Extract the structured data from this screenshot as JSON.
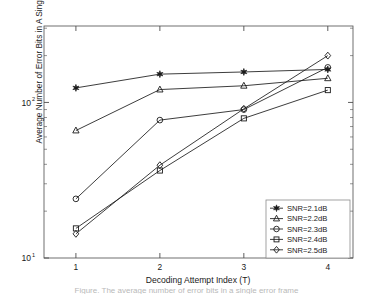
{
  "chart_data": {
    "type": "line",
    "title": "",
    "xlabel": "Decoding Attempt Index (T)",
    "ylabel": "Average Number of Error Bits in A Single Error Frame",
    "x": [
      1,
      2,
      3,
      4
    ],
    "xtick_labels": [
      "1",
      "2",
      "3",
      "4"
    ],
    "xlim": [
      0.62,
      4.3
    ],
    "ylim": [
      10,
      310
    ],
    "yscale": "log",
    "ytick_labels": [
      "10",
      "10"
    ],
    "ytick_exponents": [
      "1",
      "2"
    ],
    "ytick_values": [
      10,
      100
    ],
    "grid": false,
    "legend_position": "lower right",
    "series": [
      {
        "name": "SNR=2.1dB",
        "marker": "star",
        "values": [
          124,
          152,
          157,
          163
        ]
      },
      {
        "name": "SNR=2.2dB",
        "marker": "triangle",
        "values": [
          66,
          121,
          128,
          143
        ]
      },
      {
        "name": "SNR=2.3dB",
        "marker": "circle",
        "values": [
          24.0,
          77,
          90,
          168
        ]
      },
      {
        "name": "SNR=2.4dB",
        "marker": "square",
        "values": [
          15.5,
          36.5,
          79,
          120
        ]
      },
      {
        "name": "SNR=2.5dB",
        "marker": "diamond",
        "values": [
          14.3,
          39.5,
          91,
          200
        ]
      }
    ]
  },
  "legend": {
    "entries": [
      {
        "label": "SNR=2.1dB",
        "marker": "star"
      },
      {
        "label": "SNR=2.2dB",
        "marker": "triangle"
      },
      {
        "label": "SNR=2.3dB",
        "marker": "circle"
      },
      {
        "label": "SNR=2.4dB",
        "marker": "square"
      },
      {
        "label": "SNR=2.5dB",
        "marker": "diamond"
      }
    ]
  },
  "colors": {
    "line": "#1a1a1a",
    "axis": "#4d4d4d",
    "background": "#ffffff",
    "legend_border": "#8c8c8c"
  },
  "caption": {
    "text": "Figure. The average number of error bits in a single error frame"
  }
}
